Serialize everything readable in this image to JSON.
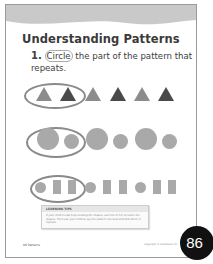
{
  "page": {
    "title": "Understanding Patterns",
    "question_number": "1.",
    "question_circled_word": "Circle",
    "question_rest": " the part of the pattern that repeats.",
    "tip_heading": "LEARNING TIPS",
    "tip_body": "If your child needs help locating the shapes, ask him or her to name the shapes. Then ask your child to say the pattern out loud and find where it repeats.",
    "footer_left": "86  Patterns",
    "footer_right": "Copyright © Scholastic Inc.",
    "page_badge": "86"
  },
  "rows": [
    {
      "type": "triangles",
      "pattern": [
        "light",
        "dark",
        "light",
        "dark",
        "light",
        "dark"
      ],
      "circled_count": 2
    },
    {
      "type": "circles",
      "pattern": [
        "big",
        "small",
        "big",
        "small",
        "big",
        "small"
      ],
      "circled_count": 2
    },
    {
      "type": "circle-rect",
      "pattern": [
        "circle",
        "rect",
        "rect",
        "circle",
        "rect",
        "rect",
        "circle",
        "rect",
        "rect"
      ],
      "circled_count": 3
    }
  ],
  "colors": {
    "banner": "#c9c9c9",
    "light_shape": "#8c8c8c",
    "dark_shape": "#4a4a4a",
    "circle": "#a9a9a9",
    "ellipse": "#8a8a8a",
    "badge": "#111111"
  }
}
